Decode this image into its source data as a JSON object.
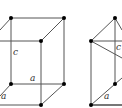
{
  "figure": {
    "colors": {
      "line": "#555555",
      "dot": "#000000",
      "label": "#333333",
      "background": "#ffffff"
    },
    "left_prism": {
      "labels": {
        "vertical_edge": "c",
        "base_edge_back": "a",
        "base_edge_side": "a"
      }
    },
    "right_prism": {
      "labels": {
        "vertical_edge": "c",
        "base_edge": "a"
      }
    }
  }
}
